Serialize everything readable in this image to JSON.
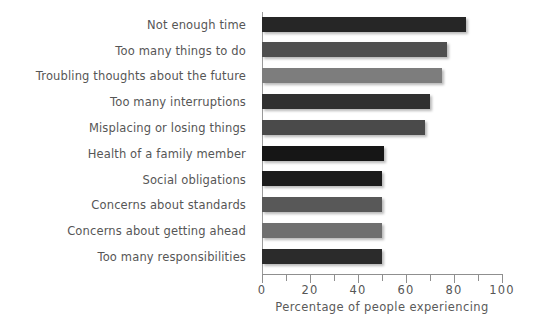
{
  "chart_data": {
    "type": "bar",
    "orientation": "horizontal",
    "title": "",
    "xlabel": "Percentage of people experiencing",
    "ylabel": "",
    "xlim": [
      0,
      100
    ],
    "grid": false,
    "legend": null,
    "xticks": [
      0,
      10,
      20,
      30,
      40,
      50,
      60,
      70,
      80,
      90,
      100
    ],
    "xtick_labels": [
      "0",
      "",
      "20",
      "",
      "40",
      "",
      "60",
      "",
      "80",
      "",
      "100"
    ],
    "categories": [
      "Not enough time",
      "Too many things to do",
      "Troubling thoughts about the future",
      "Too many interruptions",
      "Misplacing or losing things",
      "Health of a family member",
      "Social obligations",
      "Concerns about standards",
      "Concerns about getting ahead",
      "Too many responsibilities"
    ],
    "values": [
      85,
      77,
      75,
      70,
      68,
      51,
      50,
      50,
      50,
      50
    ],
    "bar_colors": [
      "#262626",
      "#4f4f4f",
      "#7d7d7d",
      "#303030",
      "#4a4a4a",
      "#161616",
      "#1b1b1b",
      "#585858",
      "#6f6f6f",
      "#2b2b2b"
    ]
  }
}
